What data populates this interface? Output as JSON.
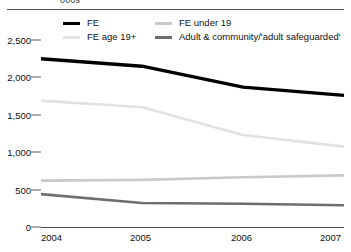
{
  "top_fragment": "000s",
  "legend": {
    "items": [
      {
        "label": "FE",
        "color": "#000000",
        "col": 0,
        "row": 0
      },
      {
        "label": "FE under 19",
        "color": "#c9c9c9",
        "col": 1,
        "row": 0
      },
      {
        "label": "FE age 19+",
        "color": "#e2e2e2",
        "col": 0,
        "row": 1
      },
      {
        "label": "Adult & community/'adult safeguarded'",
        "color": "#6e6e6e",
        "col": 1,
        "row": 1
      }
    ]
  },
  "chart_data": {
    "type": "line",
    "title": "",
    "xlabel": "",
    "ylabel": "000s",
    "categories": [
      "2004",
      "2005",
      "2006",
      "2007"
    ],
    "x": [
      2004,
      2005,
      2006,
      2007
    ],
    "xlim": [
      2004,
      2007
    ],
    "ylim": [
      0,
      2500
    ],
    "yticks": [
      0,
      500,
      1000,
      1500,
      2000,
      2500
    ],
    "ytick_labels": [
      "0",
      "500",
      "1,000",
      "1,500",
      "2,000",
      "2,500"
    ],
    "grid": false,
    "legend_position": "top",
    "series": [
      {
        "name": "FE",
        "color": "#000000",
        "width": 3.4,
        "values": [
          2250,
          2150,
          1870,
          1760
        ]
      },
      {
        "name": "FE age 19+",
        "color": "#e2e2e2",
        "width": 2.6,
        "values": [
          1690,
          1600,
          1230,
          1075
        ]
      },
      {
        "name": "FE under 19",
        "color": "#c9c9c9",
        "width": 2.6,
        "values": [
          620,
          630,
          665,
          690
        ]
      },
      {
        "name": "Adult & community/'adult safeguarded'",
        "color": "#6e6e6e",
        "width": 2.6,
        "values": [
          440,
          320,
          310,
          290
        ]
      }
    ]
  }
}
